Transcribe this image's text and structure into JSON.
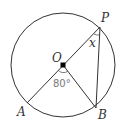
{
  "diagram": {
    "type": "circle-geometry",
    "circle": {
      "center": [
        63,
        65
      ],
      "radius": 52,
      "stroke": "#333333"
    },
    "points": {
      "O": {
        "label": "O",
        "pos": [
          63,
          65
        ]
      },
      "P": {
        "label": "P",
        "pos": [
          100,
          27
        ]
      },
      "A": {
        "label": "A",
        "pos": [
          27,
          103
        ]
      },
      "B": {
        "label": "B",
        "pos": [
          96,
          108
        ]
      }
    },
    "segments": [
      "A-P (diameter through O)",
      "O-B",
      "P-B"
    ],
    "angles": {
      "AOB": {
        "label": "80°",
        "value_deg": 80
      },
      "OPB": {
        "label": "x"
      }
    },
    "colors": {
      "line": "#333333",
      "angle_text": "#777777",
      "center_dot": "#000000"
    }
  }
}
